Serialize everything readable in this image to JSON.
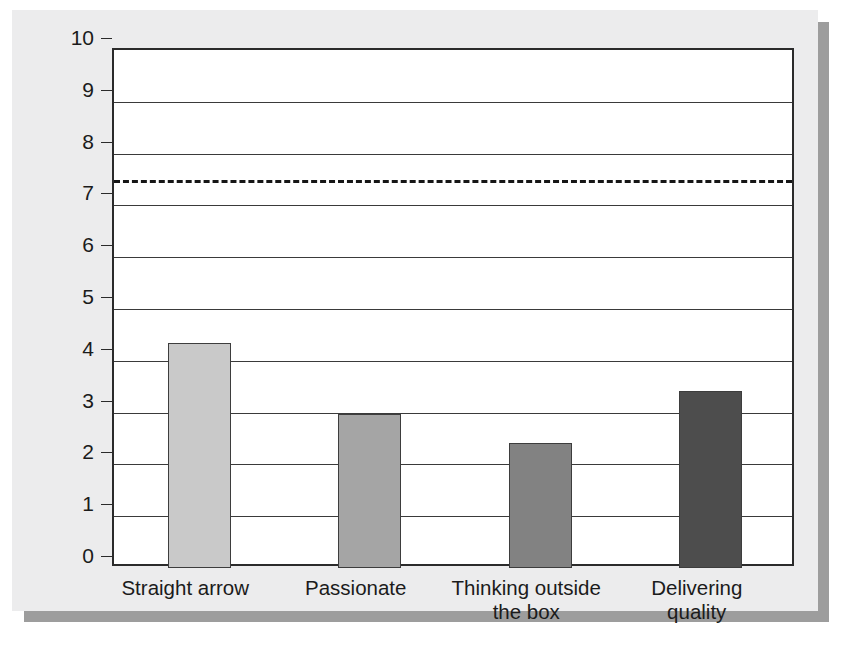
{
  "chart_data": {
    "type": "bar",
    "title": "",
    "xlabel": "",
    "ylabel": "",
    "categories": [
      "Straight arrow",
      "Passionate",
      "Thinking outside\nthe box",
      "Delivering\nquality"
    ],
    "category_lines": [
      [
        "Straight arrow"
      ],
      [
        "Passionate"
      ],
      [
        "Thinking outside",
        "the box"
      ],
      [
        "Delivering",
        "quality"
      ]
    ],
    "values": [
      4.35,
      2.98,
      2.42,
      3.42
    ],
    "bar_colors": [
      "#c9c9c9",
      "#a5a5a5",
      "#828282",
      "#4d4d4d"
    ],
    "ylim": [
      0,
      10
    ],
    "ytick_labels": [
      "0",
      "1",
      "2",
      "3",
      "4",
      "5",
      "6",
      "7",
      "8",
      "9",
      "10"
    ],
    "ytick_values": [
      0,
      1,
      2,
      3,
      4,
      5,
      6,
      7,
      8,
      9,
      10
    ],
    "grid": true,
    "grid_axis": "y",
    "legend": false,
    "annotations": [
      {
        "name": "benchmark-dashed-line",
        "type": "hline",
        "value": 7.5,
        "style": "dashed",
        "color": "#161616"
      }
    ]
  },
  "figure": {
    "background_color": "#ececed",
    "plot_background_color": "#ffffff",
    "axis_color": "#2b2b2b",
    "shadow_color": "#9d9d9d"
  }
}
